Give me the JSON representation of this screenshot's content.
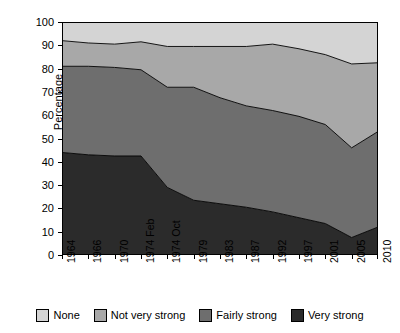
{
  "chart_data": {
    "type": "area",
    "title": "",
    "xlabel": "",
    "ylabel": "Percentage",
    "ylim": [
      0,
      100
    ],
    "ytick_step": 10,
    "yticks": [
      0,
      10,
      20,
      30,
      40,
      50,
      60,
      70,
      80,
      90,
      100
    ],
    "grid": false,
    "stacked": true,
    "stack_order": "bottom-to-top",
    "legend_position": "bottom",
    "categories": [
      "1964",
      "1966",
      "1970",
      "1974 Feb",
      "1974 Oct",
      "1979",
      "1983",
      "1987",
      "1992",
      "1997",
      "2001",
      "2005",
      "2010"
    ],
    "series": [
      {
        "name": "Very strong",
        "color": "#2b2b2b",
        "values": [
          44.0,
          43.0,
          42.5,
          42.5,
          29.0,
          23.5,
          22.0,
          20.5,
          18.5,
          16.0,
          13.5,
          7.5,
          12.0
        ]
      },
      {
        "name": "Fairly strong",
        "color": "#6e6e6e",
        "values": [
          37.0,
          38.0,
          38.0,
          37.0,
          43.0,
          48.5,
          45.5,
          43.5,
          43.5,
          43.5,
          42.5,
          38.5,
          41.0
        ]
      },
      {
        "name": "Not very strong",
        "color": "#a8a8a8",
        "values": [
          11.0,
          10.0,
          10.0,
          12.0,
          17.5,
          17.5,
          22.0,
          25.5,
          28.5,
          29.0,
          30.0,
          36.0,
          29.5
        ]
      },
      {
        "name": "None",
        "color": "#d4d4d4",
        "values": [
          8.0,
          9.0,
          9.5,
          8.5,
          10.5,
          10.5,
          10.5,
          10.5,
          9.5,
          11.5,
          14.0,
          18.0,
          17.5
        ]
      }
    ],
    "cumulative_boundaries": {
      "very_strong": [
        44.0,
        43.0,
        42.5,
        42.5,
        29.0,
        23.5,
        22.0,
        20.5,
        18.5,
        16.0,
        13.5,
        7.5,
        12.0
      ],
      "very_plus_fairly": [
        81.0,
        81.0,
        80.5,
        79.5,
        72.0,
        72.0,
        67.5,
        64.0,
        62.0,
        59.5,
        56.0,
        46.0,
        53.0
      ],
      "very_plus_fairly_plus_notvery": [
        92.0,
        91.0,
        90.5,
        91.5,
        89.5,
        89.5,
        89.5,
        89.5,
        90.5,
        88.5,
        86.0,
        82.0,
        82.5
      ]
    }
  },
  "legend": {
    "items": [
      {
        "label": "None",
        "color": "#d4d4d4"
      },
      {
        "label": "Not very strong",
        "color": "#a8a8a8"
      },
      {
        "label": "Fairly strong",
        "color": "#6e6e6e"
      },
      {
        "label": "Very strong",
        "color": "#2b2b2b"
      }
    ]
  }
}
